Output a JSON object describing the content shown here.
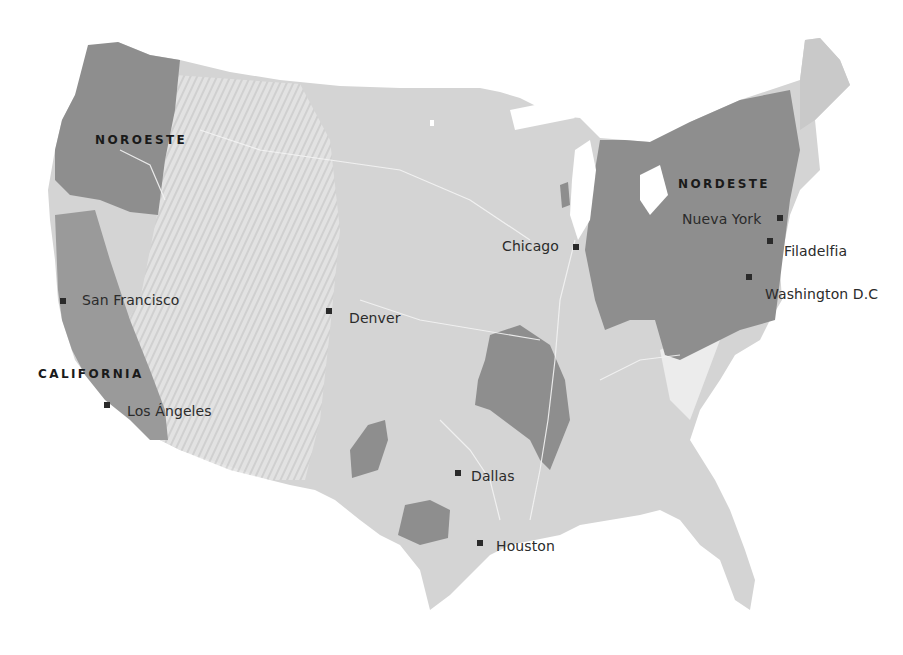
{
  "map": {
    "colors": {
      "land": "#d4d4d4",
      "land_relief": "#c6c6c6",
      "mountains": "#e6e6e6",
      "region_highlight": "#8e8e8e",
      "region_highlight_light": "#a9a9a9",
      "rivers": "#f2f2f2",
      "marker": "#2a2a2a",
      "text": "#2b2b2b",
      "background": "#ffffff"
    },
    "regions": [
      {
        "name": "NOROESTE"
      },
      {
        "name": "CALIFORNIA"
      },
      {
        "name": "NORDESTE"
      }
    ],
    "cities": [
      {
        "name": "San Francisco"
      },
      {
        "name": "Los Ángeles"
      },
      {
        "name": "Denver"
      },
      {
        "name": "Chicago"
      },
      {
        "name": "Nueva York"
      },
      {
        "name": "Filadelfia"
      },
      {
        "name": "Washington D.C"
      },
      {
        "name": "Dallas"
      },
      {
        "name": "Houston"
      }
    ]
  }
}
